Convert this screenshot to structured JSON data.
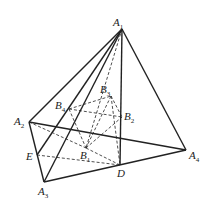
{
  "diagram": {
    "points": {
      "A1": [
        122,
        29
      ],
      "A2": [
        29,
        122
      ],
      "A3": [
        44,
        182
      ],
      "A4": [
        186,
        150
      ],
      "D": [
        120,
        165
      ],
      "E": [
        37,
        155
      ],
      "B1": [
        86,
        148
      ],
      "B2": [
        122,
        117
      ],
      "B3": [
        111,
        96
      ],
      "B4": [
        69,
        109
      ]
    },
    "labels": [
      {
        "id": "A1",
        "text": "A",
        "sub": "1",
        "x": 113,
        "y": 17
      },
      {
        "id": "A2",
        "text": "A",
        "sub": "2",
        "x": 14,
        "y": 116
      },
      {
        "id": "A3",
        "text": "A",
        "sub": "3",
        "x": 38,
        "y": 186
      },
      {
        "id": "A4",
        "text": "A",
        "sub": "4",
        "x": 189,
        "y": 150
      },
      {
        "id": "D",
        "text": "D",
        "sub": "",
        "x": 117,
        "y": 168
      },
      {
        "id": "E",
        "text": "E",
        "sub": "",
        "x": 26,
        "y": 151
      },
      {
        "id": "B1",
        "text": "B",
        "sub": "1",
        "x": 80,
        "y": 150
      },
      {
        "id": "B2",
        "text": "B",
        "sub": "2",
        "x": 124,
        "y": 111
      },
      {
        "id": "B3",
        "text": "B",
        "sub": "3",
        "x": 100,
        "y": 84
      },
      {
        "id": "B4",
        "text": "B",
        "sub": "4",
        "x": 55,
        "y": 100
      }
    ],
    "solid_edges": [
      [
        "A1",
        "A2"
      ],
      [
        "A1",
        "A3"
      ],
      [
        "A1",
        "A4"
      ],
      [
        "A1",
        "D"
      ],
      [
        "A1",
        "E"
      ],
      [
        "A2",
        "A3"
      ],
      [
        "A3",
        "A4"
      ],
      [
        "A2",
        "A4"
      ]
    ],
    "dashed_edges": [
      [
        "A1",
        "B1"
      ],
      [
        "A2",
        "B1"
      ],
      [
        "B1",
        "D"
      ],
      [
        "E",
        "D"
      ],
      [
        "B4",
        "B2"
      ],
      [
        "B4",
        "B3"
      ],
      [
        "B3",
        "B2"
      ],
      [
        "B4",
        "B1"
      ],
      [
        "B1",
        "B2"
      ],
      [
        "B3",
        "B1"
      ],
      [
        "B3",
        "D"
      ]
    ]
  }
}
